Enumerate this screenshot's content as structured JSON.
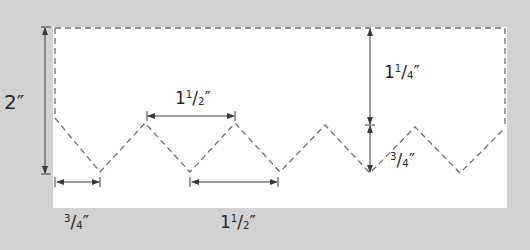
{
  "diagram": {
    "colors": {
      "background": "#d2d2d2",
      "panel": "#ffffff",
      "dashed_line": "#6e6e6e",
      "dimension_line": "#3a3a3a",
      "text": "#2a2a2a"
    },
    "dimensions": [
      {
        "id": "total-height",
        "whole": "2",
        "num": "",
        "den": "",
        "unit": "″",
        "text": "2″"
      },
      {
        "id": "peak-spacing-top",
        "whole": "1",
        "num": "1",
        "den": "2",
        "unit": "″",
        "text": "1½″"
      },
      {
        "id": "top-to-valley",
        "whole": "1",
        "num": "1",
        "den": "4",
        "unit": "″",
        "text": "1¼″"
      },
      {
        "id": "zigzag-depth",
        "whole": "",
        "num": "3",
        "den": "4",
        "unit": "″",
        "text": "¾″"
      },
      {
        "id": "first-valley-offset",
        "whole": "",
        "num": "3",
        "den": "4",
        "unit": "″",
        "text": "¾″"
      },
      {
        "id": "valley-spacing-bottom",
        "whole": "1",
        "num": "1",
        "den": "2",
        "unit": "″",
        "text": "1½″"
      }
    ],
    "zigzag_points": [
      [
        55,
        118
      ],
      [
        100,
        172
      ],
      [
        145,
        123
      ],
      [
        190,
        172
      ],
      [
        235,
        123
      ],
      [
        280,
        172
      ],
      [
        325,
        125
      ],
      [
        370,
        173
      ],
      [
        415,
        127
      ],
      [
        460,
        173
      ],
      [
        505,
        128
      ]
    ]
  }
}
